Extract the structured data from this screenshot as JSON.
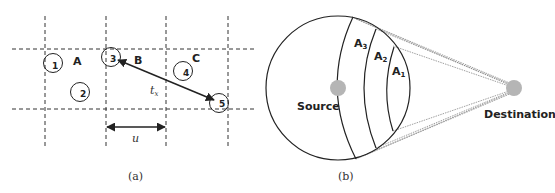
{
  "header_fragment": "...  (cut-off text)  ...",
  "panel_a": {
    "caption": "(a)",
    "cells": [
      "A",
      "B",
      "C"
    ],
    "nodes": [
      "1",
      "2",
      "3",
      "4",
      "5"
    ],
    "distance_label": "t",
    "distance_subscript": "x",
    "cell_width_label": "u"
  },
  "panel_b": {
    "caption": "(b)",
    "source_label": "Source",
    "destination_label": "Destination",
    "regions": [
      {
        "name": "A",
        "sub": "3"
      },
      {
        "name": "A",
        "sub": "2"
      },
      {
        "name": "A",
        "sub": "1"
      }
    ],
    "colors": {
      "dot": "#b5b5b5",
      "line": "#222222",
      "dotted": "#777777"
    }
  }
}
